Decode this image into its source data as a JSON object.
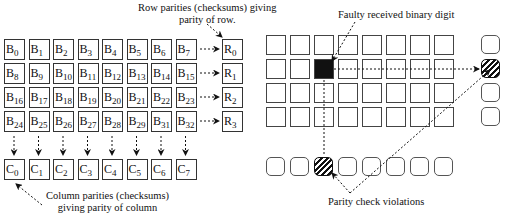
{
  "left_diagram": {
    "rows": [
      {
        "bits": [
          [
            "B",
            "0"
          ],
          [
            "B",
            "1"
          ],
          [
            "B",
            "2"
          ],
          [
            "B",
            "3"
          ],
          [
            "B",
            "4"
          ],
          [
            "B",
            "5"
          ],
          [
            "B",
            "6"
          ],
          [
            "B",
            "7"
          ]
        ],
        "parity": [
          "R",
          "0"
        ]
      },
      {
        "bits": [
          [
            "B",
            "8"
          ],
          [
            "B",
            "9"
          ],
          [
            "B",
            "10"
          ],
          [
            "B",
            "11"
          ],
          [
            "B",
            "12"
          ],
          [
            "B",
            "13"
          ],
          [
            "B",
            "14"
          ],
          [
            "B",
            "15"
          ]
        ],
        "parity": [
          "R",
          "1"
        ]
      },
      {
        "bits": [
          [
            "B",
            "16"
          ],
          [
            "B",
            "17"
          ],
          [
            "B",
            "18"
          ],
          [
            "B",
            "19"
          ],
          [
            "B",
            "20"
          ],
          [
            "B",
            "21"
          ],
          [
            "B",
            "22"
          ],
          [
            "B",
            "23"
          ]
        ],
        "parity": [
          "R",
          "2"
        ]
      },
      {
        "bits": [
          [
            "B",
            "24"
          ],
          [
            "B",
            "25"
          ],
          [
            "B",
            "26"
          ],
          [
            "B",
            "27"
          ],
          [
            "B",
            "28"
          ],
          [
            "B",
            "29"
          ],
          [
            "B",
            "31"
          ],
          [
            "B",
            "32"
          ]
        ],
        "parity": [
          "R",
          "3"
        ]
      }
    ],
    "column_parities": [
      [
        "C",
        "0"
      ],
      [
        "C",
        "1"
      ],
      [
        "C",
        "2"
      ],
      [
        "C",
        "3"
      ],
      [
        "C",
        "4"
      ],
      [
        "C",
        "5"
      ],
      [
        "C",
        "6"
      ],
      [
        "C",
        "7"
      ]
    ],
    "row_parity_note": [
      "Row parities (checksums) giving",
      "parity of row."
    ],
    "column_parity_note": [
      "Column parities (checksums)",
      "giving parity of column"
    ]
  },
  "right_diagram": {
    "grid_rows": 4,
    "grid_cols": 8,
    "faulty_cell": {
      "row": 1,
      "col": 2
    },
    "row_parity_violation": 1,
    "column_parity_violation": 2,
    "faulty_note": "Faulty received binary digit",
    "violations_note": "Parity check violations"
  }
}
